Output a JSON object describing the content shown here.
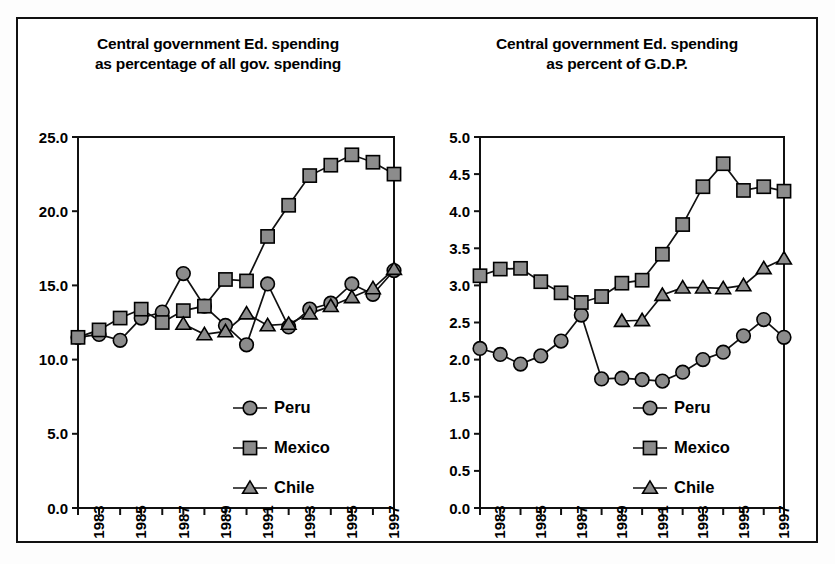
{
  "figure": {
    "panels": [
      {
        "id": "left",
        "title_line1": "Central government Ed. spending",
        "title_line2": "as percentage of all gov. spending"
      },
      {
        "id": "right",
        "title_line1": "Central government Ed. spending",
        "title_line2": "as percent of G.D.P."
      }
    ],
    "legend_entries": [
      {
        "label": "Peru",
        "marker": "circle-marker",
        "color": "#8c8c8c"
      },
      {
        "label": "Mexico",
        "marker": "square-marker",
        "color": "#8c8c8c"
      },
      {
        "label": "Chile",
        "marker": "triangle-marker",
        "color": "#8c8c8c"
      }
    ],
    "colors": {
      "line": "#111111",
      "marker_fill": "#8c8c8c",
      "marker_edge": "#000000",
      "frame": "#111111",
      "background": "#ffffff"
    }
  },
  "chart_data": [
    {
      "type": "line",
      "title": "Central government Ed. spending as percentage of all gov. spending",
      "xlabel": "",
      "ylabel": "",
      "ylim": [
        0.0,
        25.0
      ],
      "ytick_labels": [
        "0.0",
        "5.0",
        "10.0",
        "15.0",
        "20.0",
        "25.0"
      ],
      "ytick_values": [
        0.0,
        5.0,
        10.0,
        15.0,
        20.0,
        25.0
      ],
      "xlim": [
        1982,
        1997
      ],
      "x": [
        1982,
        1983,
        1984,
        1985,
        1986,
        1987,
        1988,
        1989,
        1990,
        1991,
        1992,
        1993,
        1994,
        1995,
        1996,
        1997
      ],
      "xtick_labels": [
        "1983",
        "1985",
        "1987",
        "1989",
        "1991",
        "1993",
        "1995",
        "1997"
      ],
      "xtick_values": [
        1983,
        1985,
        1987,
        1989,
        1991,
        1993,
        1995,
        1997
      ],
      "grid": false,
      "legend_position": "lower-right",
      "series": [
        {
          "name": "Peru",
          "marker": "circle",
          "x": [
            1982,
            1983,
            1984,
            1985,
            1986,
            1987,
            1988,
            1989,
            1990,
            1991,
            1992,
            1993,
            1994,
            1995,
            1996,
            1997
          ],
          "values": [
            11.5,
            11.7,
            11.3,
            12.8,
            13.2,
            15.8,
            13.6,
            12.3,
            11.0,
            15.1,
            12.2,
            13.4,
            13.8,
            15.1,
            14.4,
            16.0
          ]
        },
        {
          "name": "Mexico",
          "marker": "square",
          "x": [
            1982,
            1983,
            1984,
            1985,
            1986,
            1987,
            1988,
            1989,
            1990,
            1991,
            1992,
            1993,
            1994,
            1995,
            1996,
            1997
          ],
          "values": [
            11.5,
            12.0,
            12.8,
            13.4,
            12.5,
            13.3,
            13.6,
            15.4,
            15.3,
            18.3,
            20.4,
            22.4,
            23.1,
            23.8,
            23.3,
            22.5
          ]
        },
        {
          "name": "Chile",
          "marker": "triangle",
          "x": [
            1987,
            1988,
            1989,
            1990,
            1991,
            1992,
            1993,
            1994,
            1995,
            1996,
            1997
          ],
          "values": [
            12.4,
            11.7,
            11.9,
            13.1,
            12.3,
            12.4,
            13.1,
            13.6,
            14.2,
            14.8,
            16.1
          ]
        }
      ]
    },
    {
      "type": "line",
      "title": "Central government Ed. spending as percent of G.D.P.",
      "xlabel": "",
      "ylabel": "",
      "ylim": [
        0.0,
        5.0
      ],
      "ytick_labels": [
        "0.0",
        "0.5",
        "1.0",
        "1.5",
        "2.0",
        "2.5",
        "3.0",
        "3.5",
        "4.0",
        "4.5",
        "5.0"
      ],
      "ytick_values": [
        0.0,
        0.5,
        1.0,
        1.5,
        2.0,
        2.5,
        3.0,
        3.5,
        4.0,
        4.5,
        5.0
      ],
      "xlim": [
        1982,
        1997
      ],
      "x": [
        1982,
        1983,
        1984,
        1985,
        1986,
        1987,
        1988,
        1989,
        1990,
        1991,
        1992,
        1993,
        1994,
        1995,
        1996,
        1997
      ],
      "xtick_labels": [
        "1983",
        "1985",
        "1987",
        "1989",
        "1991",
        "1993",
        "1995",
        "1997"
      ],
      "xtick_values": [
        1983,
        1985,
        1987,
        1989,
        1991,
        1993,
        1995,
        1997
      ],
      "grid": false,
      "legend_position": "lower-right",
      "series": [
        {
          "name": "Peru",
          "marker": "circle",
          "x": [
            1982,
            1983,
            1984,
            1985,
            1986,
            1987,
            1988,
            1989,
            1990,
            1991,
            1992,
            1993,
            1994,
            1995,
            1996,
            1997
          ],
          "values": [
            2.15,
            2.07,
            1.94,
            2.05,
            2.25,
            2.6,
            1.74,
            1.75,
            1.73,
            1.71,
            1.83,
            2.0,
            2.1,
            2.32,
            2.54,
            2.3,
            2.46
          ]
        },
        {
          "name": "Mexico",
          "marker": "square",
          "x": [
            1982,
            1983,
            1984,
            1985,
            1986,
            1987,
            1988,
            1989,
            1990,
            1991,
            1992,
            1993,
            1994,
            1995,
            1996,
            1997
          ],
          "values": [
            3.13,
            3.22,
            3.23,
            3.05,
            2.9,
            2.77,
            2.85,
            3.03,
            3.07,
            3.42,
            3.82,
            4.33,
            4.64,
            4.28,
            4.33,
            4.27
          ]
        },
        {
          "name": "Chile",
          "marker": "triangle",
          "x": [
            1989,
            1990,
            1991,
            1992,
            1993,
            1994,
            1995,
            1996,
            1997
          ],
          "values": [
            2.52,
            2.53,
            2.87,
            2.97,
            2.97,
            2.96,
            3.0,
            3.23,
            3.36
          ]
        }
      ]
    }
  ]
}
